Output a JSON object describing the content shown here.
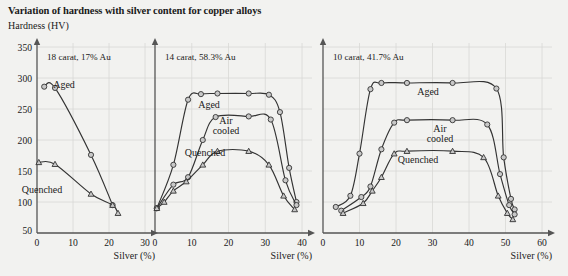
{
  "figure": {
    "title": "Variation of hardness with silver content for copper alloys",
    "y_axis_label": "Hardness (HV)",
    "x_axis_caption": "Silver (%)",
    "background_color": "#f2f2f0",
    "line_color": "#333333",
    "grid_color": "#d8d8d6",
    "marker_fill": "#c8c8c8"
  },
  "chart_data": [
    {
      "type": "line",
      "title": "18 carat, 17% Au",
      "xlabel": "Silver (%)",
      "ylabel": "Hardness (HV)",
      "xlim": [
        0,
        30
      ],
      "ylim": [
        50,
        350
      ],
      "xticks": [
        0,
        10,
        20,
        30
      ],
      "yticks": [
        50,
        100,
        150,
        200,
        250,
        300,
        350
      ],
      "grid": true,
      "legend": "inline-annotations",
      "series": [
        {
          "name": "Aged",
          "marker": "circle",
          "points": [
            {
              "x": 2.0,
              "y": 286
            },
            {
              "x": 5.0,
              "y": 284
            },
            {
              "x": 15.0,
              "y": 176
            },
            {
              "x": 21.0,
              "y": 95
            }
          ]
        },
        {
          "name": "Quenched",
          "marker": "triangle",
          "points": [
            {
              "x": 0.5,
              "y": 164
            },
            {
              "x": 5.0,
              "y": 161
            },
            {
              "x": 15.0,
              "y": 113
            },
            {
              "x": 21.0,
              "y": 95
            },
            {
              "x": 22.5,
              "y": 82
            }
          ]
        }
      ]
    },
    {
      "type": "line",
      "title": "14 carat, 58.3% Au",
      "xlabel": "Silver (%)",
      "ylabel": "Hardness (HV)",
      "xlim": [
        0,
        40
      ],
      "ylim": [
        50,
        350
      ],
      "xticks": [
        0,
        10,
        20,
        30,
        40
      ],
      "yticks": [
        50,
        100,
        150,
        200,
        250,
        300,
        350
      ],
      "grid": true,
      "legend": "inline-annotations",
      "series": [
        {
          "name": "Aged",
          "marker": "circle",
          "points": [
            {
              "x": 0.5,
              "y": 90
            },
            {
              "x": 5.0,
              "y": 160
            },
            {
              "x": 9.0,
              "y": 265
            },
            {
              "x": 12.5,
              "y": 274
            },
            {
              "x": 17.0,
              "y": 275
            },
            {
              "x": 25.5,
              "y": 275
            },
            {
              "x": 31.0,
              "y": 273
            },
            {
              "x": 34.0,
              "y": 245
            },
            {
              "x": 36.5,
              "y": 155
            },
            {
              "x": 38.5,
              "y": 100
            }
          ]
        },
        {
          "name": "Air cooled",
          "marker": "circle",
          "points": [
            {
              "x": 0.5,
              "y": 90
            },
            {
              "x": 5.0,
              "y": 128
            },
            {
              "x": 9.0,
              "y": 140
            },
            {
              "x": 13.0,
              "y": 200
            },
            {
              "x": 16.5,
              "y": 237
            },
            {
              "x": 25.5,
              "y": 238
            },
            {
              "x": 31.5,
              "y": 233
            },
            {
              "x": 35.5,
              "y": 135
            },
            {
              "x": 38.5,
              "y": 95
            }
          ]
        },
        {
          "name": "Quenched",
          "marker": "triangle",
          "points": [
            {
              "x": 0.5,
              "y": 90
            },
            {
              "x": 2.5,
              "y": 100
            },
            {
              "x": 5.0,
              "y": 118
            },
            {
              "x": 8.5,
              "y": 133
            },
            {
              "x": 13.0,
              "y": 160
            },
            {
              "x": 17.0,
              "y": 182
            },
            {
              "x": 25.5,
              "y": 182
            },
            {
              "x": 31.0,
              "y": 160
            },
            {
              "x": 35.0,
              "y": 110
            },
            {
              "x": 38.0,
              "y": 88
            }
          ]
        }
      ]
    },
    {
      "type": "line",
      "title": "10 carat, 41.7% Au",
      "xlabel": "Silver (%)",
      "ylabel": "Hardness (HV)",
      "xlim": [
        0,
        60
      ],
      "ylim": [
        50,
        350
      ],
      "xticks": [
        0,
        10,
        20,
        30,
        40,
        50,
        60
      ],
      "yticks": [
        50,
        100,
        150,
        200,
        250,
        300,
        350
      ],
      "grid": true,
      "legend": "inline-annotations",
      "series": [
        {
          "name": "Aged",
          "marker": "circle",
          "points": [
            {
              "x": 3.5,
              "y": 92
            },
            {
              "x": 7.5,
              "y": 110
            },
            {
              "x": 10.0,
              "y": 178
            },
            {
              "x": 13.0,
              "y": 282
            },
            {
              "x": 16.0,
              "y": 292
            },
            {
              "x": 23.0,
              "y": 292
            },
            {
              "x": 35.5,
              "y": 292
            },
            {
              "x": 47.5,
              "y": 283
            },
            {
              "x": 49.5,
              "y": 172
            },
            {
              "x": 51.5,
              "y": 105
            },
            {
              "x": 52.5,
              "y": 88
            }
          ]
        },
        {
          "name": "Air cooled",
          "marker": "circle",
          "points": [
            {
              "x": 5.0,
              "y": 86
            },
            {
              "x": 10.5,
              "y": 108
            },
            {
              "x": 13.0,
              "y": 125
            },
            {
              "x": 16.0,
              "y": 185
            },
            {
              "x": 19.5,
              "y": 228
            },
            {
              "x": 23.0,
              "y": 232
            },
            {
              "x": 35.5,
              "y": 232
            },
            {
              "x": 45.0,
              "y": 225
            },
            {
              "x": 48.5,
              "y": 145
            },
            {
              "x": 51.0,
              "y": 95
            },
            {
              "x": 52.5,
              "y": 80
            }
          ]
        },
        {
          "name": "Quenched",
          "marker": "triangle",
          "points": [
            {
              "x": 5.5,
              "y": 82
            },
            {
              "x": 11.0,
              "y": 98
            },
            {
              "x": 13.5,
              "y": 118
            },
            {
              "x": 16.0,
              "y": 140
            },
            {
              "x": 19.5,
              "y": 178
            },
            {
              "x": 23.0,
              "y": 182
            },
            {
              "x": 35.5,
              "y": 182
            },
            {
              "x": 44.0,
              "y": 172
            },
            {
              "x": 48.0,
              "y": 110
            },
            {
              "x": 50.5,
              "y": 82
            },
            {
              "x": 52.0,
              "y": 72
            }
          ]
        }
      ]
    }
  ]
}
